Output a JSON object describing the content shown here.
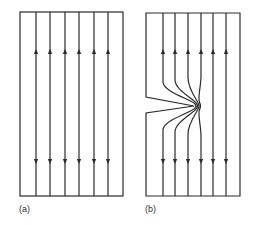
{
  "figure": {
    "panels": [
      {
        "id": "a",
        "label": "(a)",
        "description": "Uniform plate under tension, straight parallel force lines",
        "line_count": 6,
        "arrows": {
          "top": "up",
          "bottom": "down"
        },
        "has_notch": false
      },
      {
        "id": "b",
        "label": "(b)",
        "description": "Plate with edge notch, force lines crowd around notch tip",
        "line_count": 6,
        "arrows": {
          "top": "up",
          "bottom": "down"
        },
        "has_notch": true,
        "notch_side": "left"
      }
    ],
    "colors": {
      "ink": "#2a2a2a",
      "background": "#ffffff"
    }
  }
}
